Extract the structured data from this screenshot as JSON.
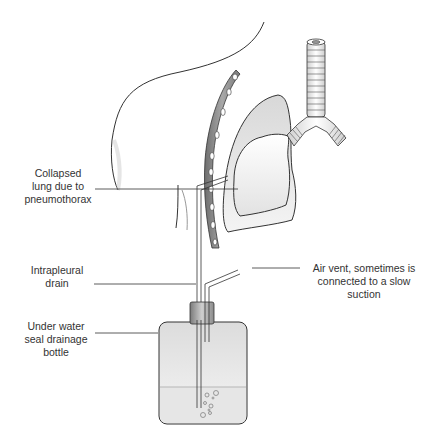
{
  "diagram": {
    "type": "medical-illustration",
    "labels": [
      {
        "id": "collapsed-lung",
        "lines": [
          "Collapsed",
          "lung due to",
          "pneumothorax"
        ]
      },
      {
        "id": "intrapleural-drain",
        "lines": [
          "Intrapleural",
          "drain"
        ]
      },
      {
        "id": "under-water-seal",
        "lines": [
          "Under water",
          "seal drainage",
          "bottle"
        ]
      },
      {
        "id": "air-vent",
        "lines": [
          "Air vent, sometimes is",
          "connected to a slow",
          "suction"
        ]
      }
    ],
    "colors": {
      "outline": "#333333",
      "fill_light": "#f2f2f2",
      "fill_mid": "#d9d9d9",
      "rib": "#8a8a8a",
      "water": "#e8e8e8",
      "leader": "#333333"
    }
  }
}
